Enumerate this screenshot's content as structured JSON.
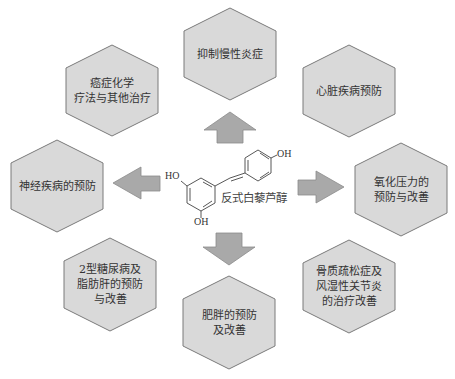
{
  "center": {
    "compound_name": "反式白藜芦醇",
    "groups": {
      "ho_left": "HO",
      "oh_bottom": "OH",
      "oh_right": "OH"
    }
  },
  "hexagons": [
    {
      "id": "anti-inflammation",
      "label": "抑制慢性炎症"
    },
    {
      "id": "cancer",
      "label": "癌症化学\n疗法与其他治疗"
    },
    {
      "id": "heart",
      "label": "心脏疾病预防"
    },
    {
      "id": "neuro",
      "label": "神经疾病的预防"
    },
    {
      "id": "oxidative",
      "label": "氧化压力的\n预防与改善"
    },
    {
      "id": "diabetes",
      "label": "2型糖尿病及\n脂肪肝的预防\n与改善"
    },
    {
      "id": "obesity",
      "label": "肥胖的预防\n及改善"
    },
    {
      "id": "bone",
      "label": "骨质疏松症及\n风湿性关节炎\n的治疗改善"
    }
  ],
  "arrows": [
    {
      "direction": "up"
    },
    {
      "direction": "left"
    },
    {
      "direction": "right"
    },
    {
      "direction": "down"
    }
  ],
  "colors": {
    "hex_fill": "#d9d9d9",
    "hex_stroke": "#7a7a7a",
    "arrow_fill": "#a9a9a9",
    "arrow_stroke": "#8a8a8a",
    "text": "#333333"
  }
}
